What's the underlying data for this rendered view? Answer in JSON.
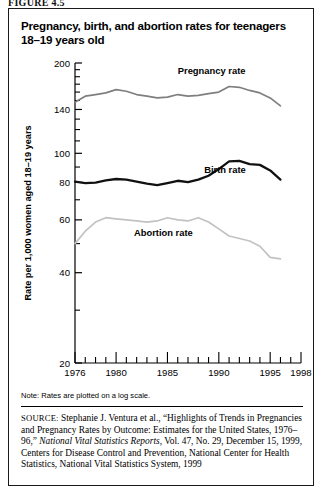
{
  "figure": {
    "label": "FIGURE 4.5"
  },
  "chart_title": "Pregnancy, birth, and abortion rates for teenagers 18–19 years old",
  "axis": {
    "ylabel": "Rate per 1,000 women aged 18–19 years",
    "yticks": [
      200,
      140,
      100,
      80,
      60,
      40,
      20
    ],
    "ytick_labels": [
      "200",
      "140",
      "100",
      "80",
      "60",
      "40",
      "20"
    ],
    "xtick_labels": [
      "1976",
      "1980",
      "1985",
      "1990",
      "1995",
      "1998"
    ],
    "xtick_values": [
      1976,
      1980,
      1985,
      1990,
      1995,
      1998
    ]
  },
  "note": "Note: Rates are plotted on a log scale.",
  "source": {
    "tag": "SOURCE:",
    "text_1": " Stephanie J. Ventura et al., “Highlights of Trends in Pregnancies and Pregnancy Rates by Outcome: Estimates for the United States, 1976–96,” ",
    "italic": "National Vital Statistics Reports,",
    "text_2": " Vol. 47, No. 29, December 15, 1999, Centers for Disease Control and Prevention, National Center for Health Statistics, National Vital Statistics System, 1999"
  },
  "colors": {
    "pregnancy": "#7f7f7f",
    "birth": "#111111",
    "abortion": "#c2c2c2",
    "axis": "#000000",
    "frame": "#1a1a1a"
  },
  "chart_data": {
    "type": "line",
    "title": "Pregnancy, birth, and abortion rates for teenagers 18–19 years old",
    "xlabel": "",
    "ylabel": "Rate per 1,000 women aged 18–19 years",
    "yscale": "log",
    "ylim": [
      20,
      200
    ],
    "xlim": [
      1976,
      1998
    ],
    "grid": false,
    "legend": "inline-annotations",
    "x": [
      1976,
      1977,
      1978,
      1979,
      1980,
      1981,
      1982,
      1983,
      1984,
      1985,
      1986,
      1987,
      1988,
      1989,
      1990,
      1991,
      1992,
      1993,
      1994,
      1995,
      1996
    ],
    "series": [
      {
        "name": "Pregnancy rate",
        "color": "#7f7f7f",
        "label_x": 1989.3,
        "label_y": 184,
        "values": [
          148,
          155,
          157,
          159,
          163,
          161,
          157,
          155,
          153,
          154,
          157,
          155,
          156,
          158,
          160,
          167,
          166,
          162,
          159,
          153,
          144
        ]
      },
      {
        "name": "Birth rate",
        "color": "#111111",
        "label_x": 1990.6,
        "label_y": 86,
        "values": [
          80.5,
          79.6,
          79.8,
          81.2,
          82.1,
          81.7,
          80.4,
          79.2,
          78.3,
          79.6,
          81.0,
          80.2,
          81.7,
          84.2,
          88.6,
          94.0,
          94.4,
          92.1,
          91.5,
          87.7,
          81.7
        ]
      },
      {
        "name": "Abortion rate",
        "color": "#c2c2c2",
        "label_x": 1984.6,
        "label_y": 53,
        "values": [
          50,
          55,
          59,
          61,
          60.5,
          60,
          59.5,
          59,
          59.5,
          61,
          60,
          59.5,
          61,
          59,
          56,
          53,
          52,
          51,
          49,
          45,
          44.5
        ]
      }
    ]
  }
}
